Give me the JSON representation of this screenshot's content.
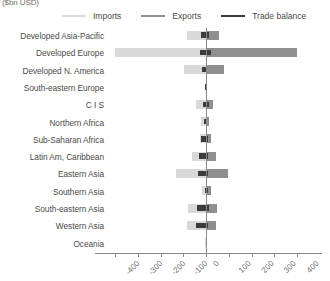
{
  "units_caption": "($bn USD)",
  "legend": {
    "position": "top",
    "items": [
      {
        "label": "Imports",
        "color": "#d9d9d9",
        "name": "imports"
      },
      {
        "label": "Exports",
        "color": "#8f8f8f",
        "name": "exports"
      },
      {
        "label": "Trade balance",
        "color": "#3c3c3c",
        "name": "trade-balance"
      }
    ]
  },
  "axis": {
    "ticks": [
      -400,
      -300,
      -200,
      -100,
      0,
      100,
      200,
      300,
      400
    ],
    "tick_labels": [
      "-400",
      "-300",
      "-200",
      "-100",
      "0",
      "100",
      "200",
      "300",
      "400"
    ],
    "xlim": [
      -400,
      400
    ],
    "zero_px": 206,
    "px_per_unit": 0.2275
  },
  "chart_data": {
    "type": "bar",
    "orientation": "horizontal",
    "title": "",
    "subtitle": "",
    "xlabel": "($bn USD)",
    "ylabel": "",
    "xlim": [
      -400,
      400
    ],
    "grid": false,
    "legend_position": "top",
    "categories": [
      "Developed Asia-Pacific",
      "Developed Europe",
      "Developed N. America",
      "South-eastern Europe",
      "C I S",
      "Northern Africa",
      "Sub-Saharan Africa",
      "Latin Am, Caribbean",
      "Eastern Asia",
      "Southern Asia",
      "South-eastern Asia",
      "Western Asia",
      "Oceania"
    ],
    "series": [
      {
        "name": "Imports",
        "color": "#d9d9d9",
        "values": [
          -85,
          -400,
          -95,
          -2,
          -45,
          -20,
          -28,
          -60,
          -130,
          -18,
          -80,
          -85,
          -3
        ]
      },
      {
        "name": "Exports",
        "color": "#8f8f8f",
        "values": [
          56,
          400,
          78,
          3,
          30,
          12,
          22,
          42,
          96,
          24,
          47,
          42,
          4
        ]
      },
      {
        "name": "Trade balance",
        "color": "#3c3c3c",
        "values": [
          [
            -22,
            12
          ],
          [
            -28,
            22
          ],
          [
            -18,
            6
          ],
          [
            -3,
            2
          ],
          [
            -12,
            14
          ],
          [
            -9,
            6
          ],
          [
            -22,
            7
          ],
          [
            -30,
            10
          ],
          [
            -34,
            10
          ],
          [
            -6,
            10
          ],
          [
            -40,
            12
          ],
          [
            -44,
            8
          ],
          [
            -2,
            2
          ]
        ]
      }
    ]
  }
}
